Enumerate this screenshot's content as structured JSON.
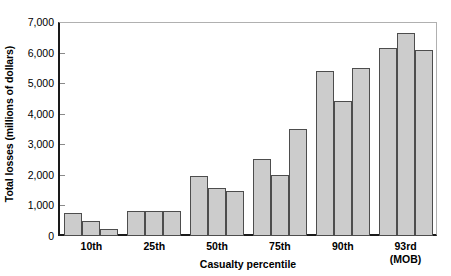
{
  "chart_data": {
    "type": "bar",
    "title": "",
    "xlabel": "Casualty percentile",
    "ylabel": "Total losses (millions of dollars)",
    "categories": [
      "10th",
      "25th",
      "50th",
      "75th",
      "90th",
      "93rd\n(MOB)"
    ],
    "category_labels": [
      {
        "main": "10th",
        "sub": ""
      },
      {
        "main": "25th",
        "sub": ""
      },
      {
        "main": "50th",
        "sub": ""
      },
      {
        "main": "75th",
        "sub": ""
      },
      {
        "main": "90th",
        "sub": ""
      },
      {
        "main": "93rd",
        "sub": "(MOB)"
      }
    ],
    "series": [
      {
        "name": "bar-1",
        "values": [
          750,
          820,
          1950,
          2520,
          5400,
          6150
        ]
      },
      {
        "name": "bar-2",
        "values": [
          500,
          820,
          1570,
          2000,
          4430,
          6650
        ]
      },
      {
        "name": "bar-3",
        "values": [
          220,
          820,
          1470,
          3500,
          5480,
          6080
        ]
      }
    ],
    "ylim": [
      0,
      7000
    ],
    "ytick_values": [
      0,
      1000,
      2000,
      3000,
      4000,
      5000,
      6000,
      7000
    ],
    "ytick_labels": [
      "0",
      "1,000",
      "2,000",
      "3,000",
      "4,000",
      "5,000",
      "6,000",
      "7,000"
    ],
    "grid": false,
    "legend": "none",
    "bar_fill_color": "#cccccc",
    "bar_edge_color": "#4d4d4d",
    "axis_color": "#1a1a1a",
    "frame_color": "#b0b0b0"
  }
}
